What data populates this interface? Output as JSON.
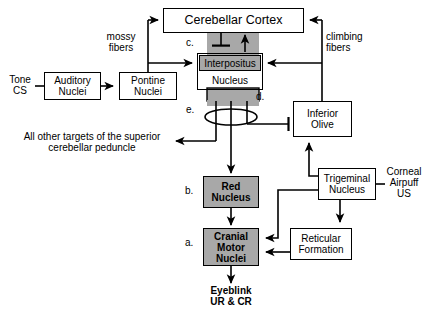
{
  "figure": {
    "type": "neuroanatomical-circuit-diagram",
    "background": "#ffffff",
    "line_color": "#000000",
    "shaded_fill": "#a8a8a8"
  },
  "nodes": [
    {
      "id": "cerebellar_cortex",
      "label": "Cerebellar Cortex",
      "shaded": false,
      "x": 163,
      "y": 8,
      "w": 141,
      "h": 25,
      "font": 12
    },
    {
      "id": "interpositus",
      "label": "Interpositus",
      "shaded": true,
      "x": 199,
      "y": 56,
      "w": 62,
      "h": 16,
      "font": 10
    },
    {
      "id": "interpositus_box",
      "label": "",
      "shaded": false,
      "x": 197,
      "y": 54,
      "w": 66,
      "h": 36,
      "font": 10
    },
    {
      "id": "nucleus_word",
      "label": "Nucleus",
      "shaded": false,
      "x": 199,
      "y": 72,
      "w": 62,
      "h": 15,
      "font": 10
    },
    {
      "id": "auditory_nuclei",
      "label": "Auditory\nNuclei",
      "shaded": false,
      "x": 44,
      "y": 72,
      "w": 57,
      "h": 28,
      "font": 10
    },
    {
      "id": "pontine_nuclei",
      "label": "Pontine Nuclei",
      "shaded": false,
      "x": 119,
      "y": 72,
      "w": 58,
      "h": 28,
      "font": 10
    },
    {
      "id": "inferior_olive",
      "label": "Inferior\nOlive",
      "shaded": false,
      "x": 293,
      "y": 101,
      "w": 59,
      "h": 35,
      "font": 10
    },
    {
      "id": "red_nucleus",
      "label": "Red\nNucleus",
      "shaded": true,
      "x": 203,
      "y": 176,
      "w": 56,
      "h": 32,
      "font": 10
    },
    {
      "id": "trigeminal_nucleus",
      "label": "Trigeminal\nNucleus",
      "shaded": false,
      "x": 318,
      "y": 168,
      "w": 58,
      "h": 32,
      "font": 10
    },
    {
      "id": "cranial_motor",
      "label": "Cranial\nMotor\nNuclei",
      "shaded": true,
      "x": 203,
      "y": 228,
      "w": 56,
      "h": 38,
      "font": 10
    },
    {
      "id": "reticular_formation",
      "label": "Reticular\nFormation",
      "shaded": false,
      "x": 290,
      "y": 228,
      "w": 62,
      "h": 32,
      "font": 10
    }
  ],
  "node_labels": {
    "cerebellar_cortex": "Cerebellar Cortex",
    "interpositus_line1": "Interpositus",
    "interpositus_line2": "Nucleus",
    "auditory_line1": "Auditory",
    "auditory_line2": "Nuclei",
    "pontine_line1": "Pontine",
    "pontine_line2": "Nuclei",
    "inferior_olive_line1": "Inferior",
    "inferior_olive_line2": "Olive",
    "red_nucleus_line1": "Red",
    "red_nucleus_line2": "Nucleus",
    "trigeminal_line1": "Trigeminal",
    "trigeminal_line2": "Nucleus",
    "cranial_line1": "Cranial",
    "cranial_line2": "Motor",
    "cranial_line3": "Nuclei",
    "reticular_line1": "Reticular",
    "reticular_line2": "Formation"
  },
  "free_labels": {
    "tone_cs_line1": "Tone",
    "tone_cs_line2": "CS",
    "mossy_line1": "mossy",
    "mossy_line2": "fibers",
    "climbing_line1": "climbing",
    "climbing_line2": "fibers",
    "corneal_line1": "Corneal",
    "corneal_line2": "Airpuff",
    "corneal_line3": "US",
    "all_other_line1": "All other targets of the superior",
    "all_other_line2": "cerebellar peduncle",
    "eyeblink_line1": "Eyeblink",
    "eyeblink_line2": "UR & CR"
  },
  "key_markers": {
    "a": "a.",
    "b": "b.",
    "c": "c.",
    "d": "d.",
    "e": "e."
  },
  "connections": [
    {
      "from": "Tone CS",
      "to": "Auditory Nuclei",
      "kind": "plain"
    },
    {
      "from": "Auditory Nuclei",
      "to": "Pontine Nuclei",
      "kind": "arrow"
    },
    {
      "from": "Pontine Nuclei",
      "to": "Cerebellar Cortex",
      "kind": "arrow",
      "pathway": "mossy fibers"
    },
    {
      "from": "Pontine Nuclei",
      "to": "Interpositus Nucleus",
      "kind": "arrow",
      "pathway": "mossy fibers"
    },
    {
      "from": "Inferior Olive",
      "to": "Cerebellar Cortex",
      "kind": "arrow",
      "pathway": "climbing fibers"
    },
    {
      "from": "Inferior Olive",
      "to": "Interpositus Nucleus",
      "kind": "arrow",
      "pathway": "climbing fibers"
    },
    {
      "from": "Cerebellar Cortex",
      "to": "Interpositus Nucleus",
      "kind": "inhibitory"
    },
    {
      "from": "Interpositus Nucleus",
      "to": "Cerebellar Cortex",
      "kind": "arrow"
    },
    {
      "from": "Interpositus Nucleus",
      "to": "superior cerebellar peduncle targets",
      "kind": "arrow"
    },
    {
      "from": "Interpositus Nucleus",
      "to": "Inferior Olive",
      "kind": "inhibitory"
    },
    {
      "from": "Interpositus Nucleus",
      "to": "Red Nucleus",
      "kind": "arrow"
    },
    {
      "from": "Red Nucleus",
      "to": "Cranial Motor Nuclei",
      "kind": "arrow"
    },
    {
      "from": "Corneal Airpuff US",
      "to": "Trigeminal Nucleus",
      "kind": "plain"
    },
    {
      "from": "Trigeminal Nucleus",
      "to": "Inferior Olive",
      "kind": "arrow"
    },
    {
      "from": "Trigeminal Nucleus",
      "to": "Cranial Motor Nuclei",
      "kind": "arrow"
    },
    {
      "from": "Trigeminal Nucleus",
      "to": "Reticular Formation",
      "kind": "arrow"
    },
    {
      "from": "Reticular Formation",
      "to": "Cranial Motor Nuclei",
      "kind": "arrow"
    },
    {
      "from": "Cranial Motor Nuclei",
      "to": "Eyeblink UR & CR",
      "kind": "arrow"
    }
  ]
}
